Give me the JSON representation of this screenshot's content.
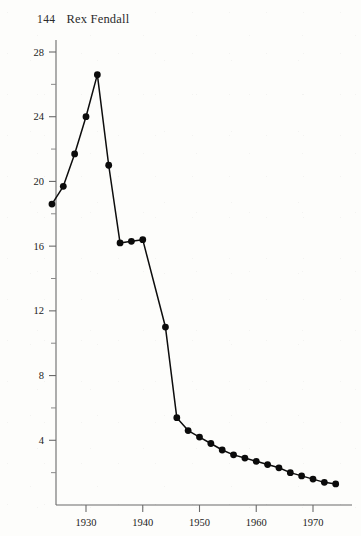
{
  "page": {
    "folio": "144",
    "running_title": "Rex Fendall",
    "background_color": "#fdfdfb",
    "ink_color": "#0d0d0d"
  },
  "chart_data": {
    "type": "line",
    "title": "",
    "subtitle": "",
    "xlabel": "",
    "ylabel": "",
    "xlim": [
      1922,
      1977
    ],
    "ylim": [
      0,
      29
    ],
    "grid": false,
    "legend": false,
    "legend_position": "none",
    "marker": "filled-circle",
    "x_ticks_major": [
      1930,
      1940,
      1950,
      1960,
      1970
    ],
    "x_tick_labels": [
      "1930",
      "1940",
      "1950",
      "1960",
      "1970"
    ],
    "x_ticks_minor": [
      1925,
      1935,
      1945,
      1955,
      1965,
      1975
    ],
    "y_ticks_major": [
      4,
      8,
      12,
      16,
      20,
      24,
      28
    ],
    "y_tick_labels": [
      "4",
      "8",
      "12",
      "16",
      "20",
      "24",
      "28"
    ],
    "y_ticks_minor": [
      2,
      6,
      10,
      14,
      18,
      22,
      26
    ],
    "series": [
      {
        "name": "series-1",
        "x": [
          1924,
          1926,
          1928,
          1930,
          1932,
          1934,
          1935,
          1936,
          1938,
          1940,
          1941,
          1943,
          1944,
          1948,
          1950,
          1951,
          1952,
          1953,
          1954,
          1955,
          1956,
          1957,
          1958,
          1959,
          1960,
          1961,
          1962,
          1963,
          1964,
          1966,
          1968,
          1970,
          1972,
          1974
        ],
        "y": [
          18.6,
          19.7,
          21.7,
          24.0,
          26.6,
          21.0,
          16.2,
          16.3,
          16.4,
          11.0,
          5.4,
          4.6,
          4.2,
          3.8,
          3.4,
          3.1,
          2.9,
          2.7,
          2.5,
          2.3,
          2.2,
          2.0,
          1.9,
          1.8,
          1.7,
          1.6,
          1.5,
          1.45,
          1.4,
          1.3,
          1.25,
          1.2,
          1.2,
          1.2
        ]
      }
    ],
    "points": [
      {
        "x": 1924,
        "y": 18.6
      },
      {
        "x": 1926,
        "y": 19.7
      },
      {
        "x": 1928,
        "y": 21.7
      },
      {
        "x": 1930,
        "y": 24.0
      },
      {
        "x": 1932,
        "y": 26.6
      },
      {
        "x": 1934,
        "y": 21.0
      },
      {
        "x": 1936,
        "y": 16.2
      },
      {
        "x": 1938,
        "y": 16.3
      },
      {
        "x": 1940,
        "y": 16.4
      },
      {
        "x": 1944,
        "y": 11.0
      },
      {
        "x": 1946,
        "y": 5.4
      },
      {
        "x": 1948,
        "y": 4.6
      },
      {
        "x": 1950,
        "y": 4.2
      },
      {
        "x": 1952,
        "y": 3.8
      },
      {
        "x": 1954,
        "y": 3.4
      },
      {
        "x": 1956,
        "y": 3.1
      },
      {
        "x": 1958,
        "y": 2.9
      },
      {
        "x": 1960,
        "y": 2.7
      },
      {
        "x": 1962,
        "y": 2.5
      },
      {
        "x": 1964,
        "y": 2.3
      },
      {
        "x": 1966,
        "y": 2.0
      },
      {
        "x": 1968,
        "y": 1.8
      },
      {
        "x": 1970,
        "y": 1.6
      },
      {
        "x": 1972,
        "y": 1.4
      },
      {
        "x": 1974,
        "y": 1.3
      }
    ]
  }
}
